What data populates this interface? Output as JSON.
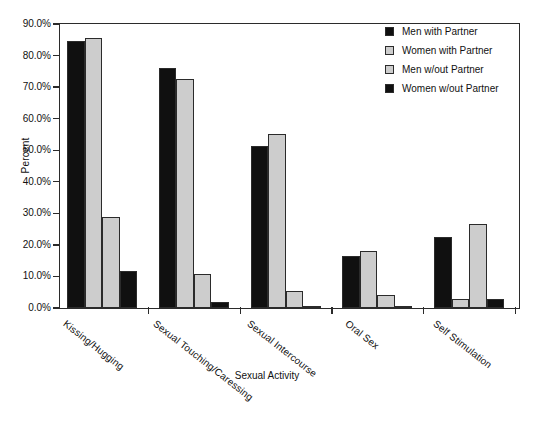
{
  "chart_data": {
    "type": "bar",
    "title": "",
    "xlabel": "Sexual Activity",
    "ylabel": "Percent",
    "ylim": [
      0,
      90
    ],
    "ytick_labels": [
      "0.0%",
      "10.0%",
      "20.0%",
      "30.0%",
      "40.0%",
      "50.0%",
      "60.0%",
      "70.0%",
      "80.0%",
      "90.0%"
    ],
    "ytick_values": [
      0,
      10,
      20,
      30,
      40,
      50,
      60,
      70,
      80,
      90
    ],
    "grid": false,
    "legend_position": "top-right",
    "categories": [
      "Kissing/Hugging",
      "Sexual Touching/Caressing",
      "Sexual Intercourse",
      "Oral Sex",
      "Self Stimulation"
    ],
    "series": [
      {
        "name": "Men with Partner",
        "color": "#101010",
        "swatch": "dark",
        "values": [
          84.5,
          76.0,
          51.5,
          16.5,
          22.5
        ]
      },
      {
        "name": "Women with Partner",
        "color": "#cdcdcd",
        "swatch": "light",
        "values": [
          85.5,
          72.5,
          55.0,
          18.0,
          3.0
        ]
      },
      {
        "name": "Men w/out Partner",
        "color": "#cdcdcd",
        "swatch": "light",
        "values": [
          29.0,
          10.8,
          5.5,
          4.0,
          26.5
        ]
      },
      {
        "name": "Women w/out Partner",
        "color": "#101010",
        "swatch": "dark",
        "values": [
          11.8,
          2.0,
          0.6,
          0.2,
          3.0
        ]
      }
    ]
  },
  "legend": {
    "entries": [
      {
        "label": "Men with Partner",
        "swatch": "dark"
      },
      {
        "label": "Women with Partner",
        "swatch": "light"
      },
      {
        "label": "Men w/out Partner",
        "swatch": "light"
      },
      {
        "label": "Women w/out Partner",
        "swatch": "dark"
      }
    ]
  },
  "axes": {
    "y_title": "Percent",
    "x_title": "Sexual Activity"
  }
}
